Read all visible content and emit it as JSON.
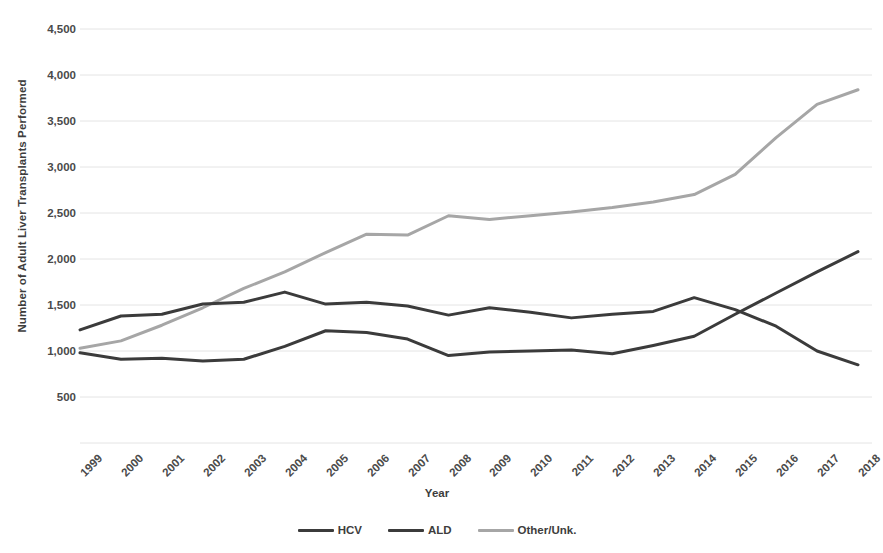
{
  "chart_data": {
    "type": "line",
    "title": "",
    "xlabel": "Year",
    "ylabel": "Number of Adult Liver Transplants Performed",
    "categories": [
      "1999",
      "2000",
      "2001",
      "2002",
      "2003",
      "2004",
      "2005",
      "2006",
      "2007",
      "2008",
      "2009",
      "2010",
      "2011",
      "2012",
      "2013",
      "2014",
      "2015",
      "2016",
      "2017",
      "2018"
    ],
    "x": [
      1999,
      2000,
      2001,
      2002,
      2003,
      2004,
      2005,
      2006,
      2007,
      2008,
      2009,
      2010,
      2011,
      2012,
      2013,
      2014,
      2015,
      2016,
      2017,
      2018
    ],
    "ylim": [
      0,
      4500
    ],
    "xlim": [
      1999,
      2018
    ],
    "yticks": [
      500,
      1000,
      1500,
      2000,
      2500,
      3000,
      3500,
      4000,
      4500
    ],
    "ytick_labels": [
      "500",
      "1,000",
      "1,500",
      "2,000",
      "2,500",
      "3,000",
      "3,500",
      "4,000",
      "4,500"
    ],
    "grid": true,
    "legend_position": "bottom",
    "series": [
      {
        "name": "HCV",
        "color": "#3b3b3b",
        "values": [
          1230,
          1380,
          1400,
          1510,
          1530,
          1640,
          1510,
          1530,
          1490,
          1390,
          1470,
          1420,
          1360,
          1400,
          1430,
          1580,
          1450,
          1270,
          1000,
          850
        ]
      },
      {
        "name": "ALD",
        "color": "#3b3b3b",
        "values": [
          980,
          910,
          920,
          890,
          910,
          1050,
          1220,
          1200,
          1130,
          950,
          990,
          1000,
          1010,
          970,
          1060,
          1160,
          1400,
          1630,
          1860,
          2080
        ]
      },
      {
        "name": "Other/Unk.",
        "color": "#a6a6a6",
        "values": [
          1030,
          1110,
          1280,
          1470,
          1680,
          1860,
          2070,
          2270,
          2260,
          2470,
          2430,
          2470,
          2510,
          2560,
          2620,
          2700,
          2920,
          3320,
          3680,
          3840
        ]
      }
    ]
  },
  "legend": {
    "items": [
      {
        "label": "HCV",
        "color": "#3b3b3b"
      },
      {
        "label": "ALD",
        "color": "#3b3b3b"
      },
      {
        "label": "Other/Unk.",
        "color": "#a6a6a6"
      }
    ]
  },
  "axes": {
    "y_title": "Number of Adult Liver Transplants Performed",
    "x_title": "Year"
  },
  "colors": {
    "grid": "#e4e4e4",
    "text": "#3f3f3f",
    "dark_series": "#3b3b3b",
    "light_series": "#a6a6a6",
    "background": "#ffffff"
  }
}
